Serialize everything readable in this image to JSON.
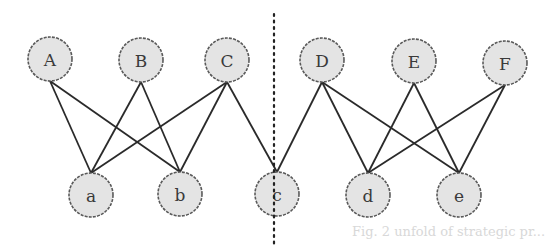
{
  "diagram": {
    "type": "bipartite-graph",
    "top_nodes": [
      {
        "id": "A",
        "label": "A",
        "x": 50,
        "y": 59
      },
      {
        "id": "B",
        "label": "B",
        "x": 141,
        "y": 60
      },
      {
        "id": "C",
        "label": "C",
        "x": 227,
        "y": 60
      },
      {
        "id": "D",
        "label": "D",
        "x": 322,
        "y": 60
      },
      {
        "id": "E",
        "label": "E",
        "x": 414,
        "y": 61
      },
      {
        "id": "F",
        "label": "F",
        "x": 505,
        "y": 63
      }
    ],
    "bottom_nodes": [
      {
        "id": "a",
        "label": "a",
        "x": 91,
        "y": 195
      },
      {
        "id": "b",
        "label": "b",
        "x": 180,
        "y": 194
      },
      {
        "id": "c",
        "label": "c",
        "x": 277,
        "y": 194
      },
      {
        "id": "d",
        "label": "d",
        "x": 368,
        "y": 195
      },
      {
        "id": "e",
        "label": "e",
        "x": 459,
        "y": 195
      }
    ],
    "edges": [
      [
        "A",
        "a"
      ],
      [
        "A",
        "b"
      ],
      [
        "B",
        "a"
      ],
      [
        "B",
        "b"
      ],
      [
        "C",
        "a"
      ],
      [
        "C",
        "b"
      ],
      [
        "C",
        "c"
      ],
      [
        "D",
        "c"
      ],
      [
        "D",
        "d"
      ],
      [
        "D",
        "e"
      ],
      [
        "E",
        "d"
      ],
      [
        "E",
        "e"
      ],
      [
        "F",
        "d"
      ],
      [
        "F",
        "e"
      ]
    ],
    "divider": {
      "x": 274,
      "y1": 14,
      "y2": 246,
      "style": "dotted"
    },
    "node_radius": 22,
    "ghost_text": "Fig. 2 unfold of strategic pr..."
  }
}
